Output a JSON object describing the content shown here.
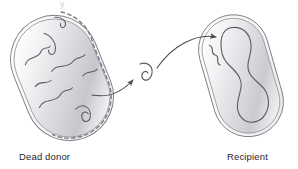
{
  "figure": {
    "title_remnant": "y",
    "background_color": "#ffffff",
    "process": "bacterial transformation",
    "labels": {
      "donor": "Dead donor",
      "recipient": "Recipient"
    }
  },
  "colors": {
    "outline": "#6f7076",
    "wall_inner": "#8c8d93",
    "dna_stroke": "#5b5c62",
    "arrow": "#4a4b50",
    "dashed_membrane": "#7a7b81",
    "cytoplasm_light": "#fdfdfd",
    "cytoplasm_mid": "#e3e3e6",
    "cytoplasm_dark": "#b9babf",
    "label_text": "#27262a",
    "background": "#ffffff"
  },
  "donor_cell": {
    "name": "Dead donor",
    "state": "lysed",
    "membrane_style": "dashed on right and bottom edge",
    "wall_style": "double line",
    "rotation_deg": -22,
    "dna": "fragmented",
    "fragment_count": 8
  },
  "recipient_cell": {
    "name": "Recipient",
    "state": "intact",
    "membrane_style": "solid",
    "wall_style": "double line",
    "rotation_deg": -16,
    "dna": "closed circular chromosome",
    "acquired_fragment": "small squiggle"
  },
  "free_dna": {
    "name": "released DNA fragment",
    "shape": "curled hook"
  },
  "arrows": [
    {
      "name": "arrow-donor-to-fragment",
      "from": "Dead donor",
      "to": "free DNA fragment"
    },
    {
      "name": "arrow-fragment-to-recipient",
      "from": "free DNA fragment",
      "to": "Recipient"
    }
  ]
}
